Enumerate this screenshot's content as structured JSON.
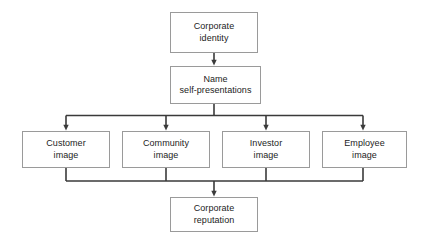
{
  "diagram": {
    "type": "flowchart",
    "background_color": "#ffffff",
    "box_border_color": "#9a9a9a",
    "connector_color": "#3a3a3a",
    "text_color": "#1c1c1c",
    "nodes": [
      {
        "id": "corporate-identity",
        "label": "Corporate\nidentity",
        "level": 1
      },
      {
        "id": "name-self-presentations",
        "label": "Name\nself-presentations",
        "level": 2
      },
      {
        "id": "customer-image",
        "label": "Customer\nimage",
        "level": 3
      },
      {
        "id": "community-image",
        "label": "Community\nimage",
        "level": 3
      },
      {
        "id": "investor-image",
        "label": "Investor\nimage",
        "level": 3
      },
      {
        "id": "employee-image",
        "label": "Employee\nimage",
        "level": 3
      },
      {
        "id": "corporate-reputation",
        "label": "Corporate\nreputation",
        "level": 4
      }
    ],
    "edges": [
      {
        "from": "corporate-identity",
        "to": "name-self-presentations",
        "arrow": true
      },
      {
        "from": "name-self-presentations",
        "to": "customer-image",
        "arrow": true
      },
      {
        "from": "name-self-presentations",
        "to": "community-image",
        "arrow": true
      },
      {
        "from": "name-self-presentations",
        "to": "investor-image",
        "arrow": true
      },
      {
        "from": "name-self-presentations",
        "to": "employee-image",
        "arrow": true
      },
      {
        "from": "customer-image",
        "to": "corporate-reputation",
        "arrow": true
      },
      {
        "from": "community-image",
        "to": "corporate-reputation",
        "arrow": true
      },
      {
        "from": "investor-image",
        "to": "corporate-reputation",
        "arrow": true
      },
      {
        "from": "employee-image",
        "to": "corporate-reputation",
        "arrow": true
      }
    ]
  }
}
